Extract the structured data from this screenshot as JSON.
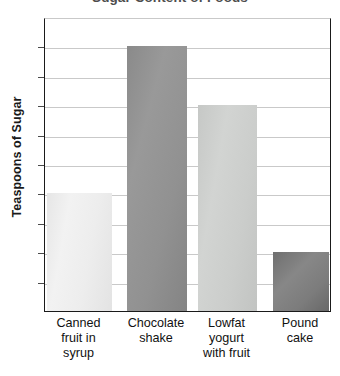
{
  "chart_data": {
    "type": "bar",
    "title": "Sugar Content of Foods",
    "xlabel": "",
    "ylabel": "Teaspoons of Sugar",
    "categories": [
      "Canned fruit in syrup",
      "Chocolate shake",
      "Lowfat yogurt with fruit",
      "Pound cake"
    ],
    "category_lines": [
      [
        "Canned",
        "fruit in",
        "syrup"
      ],
      [
        "Chocolate",
        "shake"
      ],
      [
        "Lowfat",
        "yogurt",
        "with fruit"
      ],
      [
        "Pound",
        "cake"
      ]
    ],
    "values": [
      4,
      9,
      7,
      2
    ],
    "ylim": [
      0,
      10
    ],
    "ytick_labels": [
      "0",
      "1",
      "2",
      "3",
      "4",
      "5",
      "6",
      "7",
      "8",
      "9",
      "10"
    ],
    "ytick_values": [
      0,
      1,
      2,
      3,
      4,
      5,
      6,
      7,
      8,
      9,
      10
    ],
    "grid": true,
    "legend": false,
    "bar_colors": [
      "#eeeeee",
      "#8e8e8e",
      "#c9cbc9",
      "#7b7b7b"
    ],
    "axis_color": "#1a1a1a",
    "grid_color": "#c9c9c9",
    "title_color": "#4d4d4d"
  }
}
